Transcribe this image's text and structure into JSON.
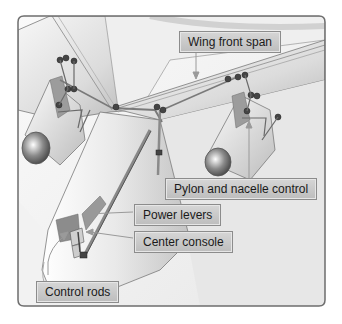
{
  "figure": {
    "labels": {
      "wing_front_span": "Wing front span",
      "pylon_nacelle": "Pylon and nacelle control",
      "power_levers": "Power levers",
      "center_console": "Center console",
      "control_rods": "Control rods"
    },
    "colors": {
      "frame_border": "#6e6e6e",
      "background": "#f2f2f2",
      "label_fill": "#c8c8c8",
      "label_border": "#8c8c8c",
      "aircraft_skin": "#e6e6e6",
      "rod": "#8a8a8a",
      "arrow": "#9a9a9a"
    }
  }
}
